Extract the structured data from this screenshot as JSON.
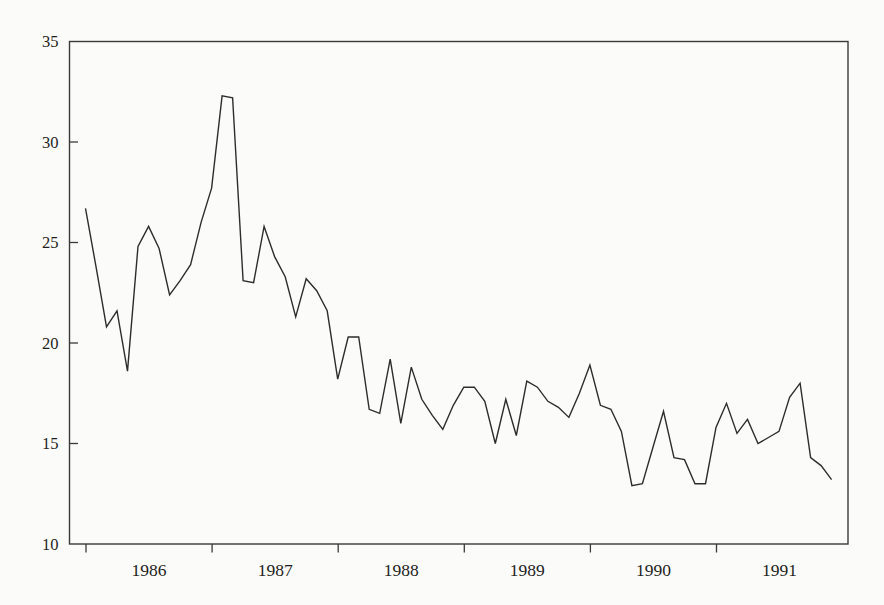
{
  "page": {
    "background_color": "#fbfbf9"
  },
  "chart_data": {
    "type": "line",
    "title": "",
    "xlabel": "",
    "ylabel": "",
    "legend": false,
    "grid": false,
    "frame": "full-box",
    "line_color": "#2e2d2b",
    "axis_color": "#3b3a38",
    "text_color": "#1f1e1c",
    "x_axis": {
      "tick_years": [
        "1986",
        "1987",
        "1988",
        "1989",
        "1990",
        "1991"
      ],
      "tick_position": "year-start",
      "label_position": "mid-year",
      "tick_direction": "outward"
    },
    "y_axis": {
      "ticks": [
        10,
        15,
        20,
        25,
        30,
        35
      ],
      "range": [
        10,
        35
      ],
      "tick_direction": "inward"
    },
    "series": [
      {
        "name": "monthly-series",
        "start": "1986-01",
        "end": "1991-12",
        "frequency": "monthly",
        "values": [
          26.7,
          23.8,
          20.8,
          21.6,
          18.6,
          24.8,
          25.8,
          24.7,
          22.4,
          23.1,
          23.9,
          26.0,
          27.7,
          32.3,
          32.2,
          23.1,
          23.0,
          25.8,
          24.3,
          23.3,
          21.3,
          23.2,
          22.6,
          21.6,
          18.2,
          20.3,
          20.3,
          16.7,
          16.5,
          19.2,
          16.0,
          18.8,
          17.2,
          16.4,
          15.7,
          16.9,
          17.8,
          17.8,
          17.1,
          15.0,
          17.2,
          15.4,
          18.1,
          17.8,
          17.1,
          16.8,
          16.3,
          17.5,
          18.9,
          16.9,
          16.7,
          15.6,
          12.9,
          13.0,
          14.8,
          16.6,
          14.3,
          14.2,
          13.0,
          13.0,
          15.8,
          17.0,
          15.5,
          16.2,
          15.0,
          15.3,
          15.6,
          17.3,
          18.0,
          14.3,
          13.9,
          13.2
        ]
      }
    ]
  }
}
